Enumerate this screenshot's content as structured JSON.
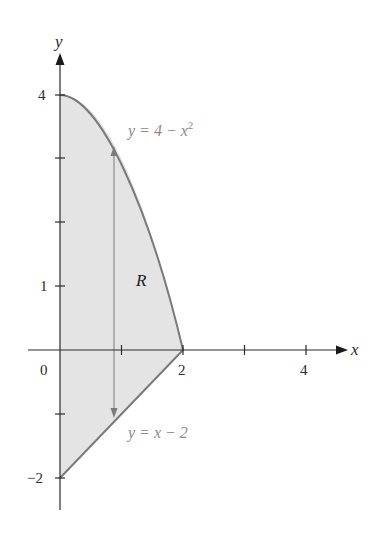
{
  "figure": {
    "axes": {
      "x_label": "x",
      "y_label": "y",
      "x_ticks": [
        {
          "value": 1,
          "label": ""
        },
        {
          "value": 2,
          "label": "2"
        },
        {
          "value": 3,
          "label": ""
        },
        {
          "value": 4,
          "label": "4"
        }
      ],
      "y_ticks": [
        {
          "value": 4,
          "label": "4"
        },
        {
          "value": 3,
          "label": ""
        },
        {
          "value": 2,
          "label": ""
        },
        {
          "value": 1,
          "label": "1"
        },
        {
          "value": -1,
          "label": ""
        },
        {
          "value": -2,
          "label": "−2"
        }
      ],
      "origin_label": "0"
    },
    "curves": {
      "upper": {
        "label": "y = 4 − x",
        "label_sup": "2"
      },
      "lower": {
        "label": "y = x − 2"
      }
    },
    "region_label": "R",
    "colors": {
      "fill": "#e4e4e4",
      "boundary": "#7a7a7a",
      "axis": "#2b2b2b",
      "label_gray": "#8a8a8a",
      "label_dark": "#2b2b2b"
    }
  }
}
